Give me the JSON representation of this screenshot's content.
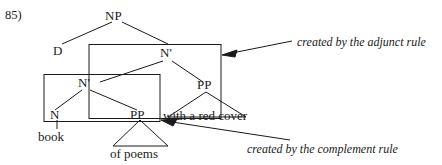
{
  "figure": {
    "example_number": "85)",
    "nodes": {
      "np": "NP",
      "d": "D",
      "n_bar_upper": "N'",
      "n_bar_lower": "N'",
      "n": "N",
      "pp_complement": "PP",
      "pp_adjunct": "PP"
    },
    "leaves": {
      "book": "book",
      "of_poems": "of poems",
      "with_a_red_cover": "with a red cover"
    },
    "annotations": {
      "adjunct": "created by the adjunct rule",
      "complement": "created by the complement rule"
    },
    "colors": {
      "ink": "#1a1a1a",
      "background": "#ffffff"
    }
  }
}
